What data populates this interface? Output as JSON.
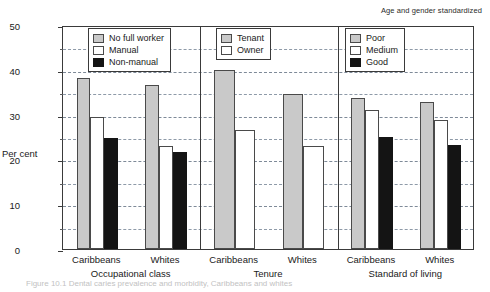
{
  "note": "Age and gender standardized",
  "axis": {
    "ylabel": "Per cent",
    "yticks": [
      "0",
      "10",
      "20",
      "30",
      "40",
      "50"
    ],
    "ymin": 0,
    "ymax": 50
  },
  "panels": [
    {
      "name": "Occupational class",
      "legend": [
        {
          "label": "No full worker",
          "fill": "gray"
        },
        {
          "label": "Manual",
          "fill": "white"
        },
        {
          "label": "Non-manual",
          "fill": "black"
        }
      ],
      "groups": [
        {
          "label": "Caribbeans",
          "values": [
            38.2,
            29.4,
            24.8
          ]
        },
        {
          "label": "Whites",
          "values": [
            36.7,
            23.0,
            21.6
          ]
        }
      ]
    },
    {
      "name": "Tenure",
      "legend": [
        {
          "label": "Tenant",
          "fill": "gray"
        },
        {
          "label": "Owner",
          "fill": "white"
        }
      ],
      "groups": [
        {
          "label": "Caribbeans",
          "values": [
            40.0,
            26.6
          ]
        },
        {
          "label": "Whites",
          "values": [
            34.6,
            22.9
          ]
        }
      ]
    },
    {
      "name": "Standard of living",
      "legend": [
        {
          "label": "Poor",
          "fill": "gray"
        },
        {
          "label": "Medium",
          "fill": "white"
        },
        {
          "label": "Good",
          "fill": "black"
        }
      ],
      "groups": [
        {
          "label": "Caribbeans",
          "values": [
            33.7,
            31.0,
            24.9
          ]
        },
        {
          "label": "Whites",
          "values": [
            32.9,
            28.8,
            23.2
          ]
        }
      ]
    }
  ],
  "caption": "Figure 10.1  Dental  caries  prevalence  and  morbidity,  Caribbeans  and  whites",
  "chart_data": {
    "type": "bar",
    "title": "",
    "subtitle": "Age and gender standardized",
    "xlabel": "",
    "ylabel": "Per cent",
    "ylim": [
      0,
      50
    ],
    "ytick_values": [
      0,
      10,
      20,
      30,
      40,
      50
    ],
    "grid": "horizontal dashed at every 5 units",
    "legend_position": "inside top of each panel",
    "panels": [
      {
        "panel": "Occupational class",
        "categories": [
          "Caribbeans",
          "Whites"
        ],
        "series": [
          {
            "name": "No full worker",
            "values": [
              38.2,
              36.7
            ]
          },
          {
            "name": "Manual",
            "values": [
              29.4,
              23.0
            ]
          },
          {
            "name": "Non-manual",
            "values": [
              24.8,
              21.6
            ]
          }
        ]
      },
      {
        "panel": "Tenure",
        "categories": [
          "Caribbeans",
          "Whites"
        ],
        "series": [
          {
            "name": "Tenant",
            "values": [
              40.0,
              34.6
            ]
          },
          {
            "name": "Owner",
            "values": [
              26.6,
              22.9
            ]
          }
        ]
      },
      {
        "panel": "Standard of living",
        "categories": [
          "Caribbeans",
          "Whites"
        ],
        "series": [
          {
            "name": "Poor",
            "values": [
              33.7,
              32.9
            ]
          },
          {
            "name": "Medium",
            "values": [
              31.0,
              28.8
            ]
          },
          {
            "name": "Good",
            "values": [
              24.9,
              23.2
            ]
          }
        ]
      }
    ]
  }
}
